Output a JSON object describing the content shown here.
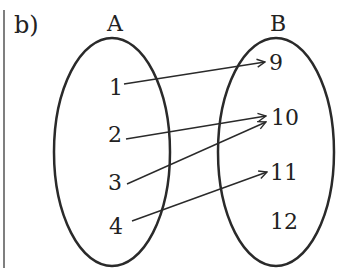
{
  "part_label": "b)",
  "set_a": {
    "label": "A",
    "elements": [
      "1",
      "2",
      "3",
      "4"
    ]
  },
  "set_b": {
    "label": "B",
    "elements": [
      "9",
      "10",
      "11",
      "12"
    ]
  },
  "mappings": [
    {
      "from": "1",
      "to": "9"
    },
    {
      "from": "2",
      "to": "10"
    },
    {
      "from": "3",
      "to": "10"
    },
    {
      "from": "4",
      "to": "11"
    }
  ],
  "colors": {
    "stroke": "#2a2a2a",
    "text": "#222222",
    "background": "#ffffff"
  }
}
